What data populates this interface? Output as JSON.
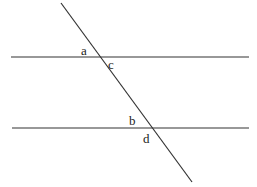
{
  "diagram": {
    "stroke_color": "#333333",
    "lines": {
      "parallel_top": {
        "x1": 11,
        "y1": 57,
        "x2": 249,
        "y2": 57
      },
      "parallel_bottom": {
        "x1": 12,
        "y1": 128,
        "x2": 249,
        "y2": 128
      },
      "transversal": {
        "x1": 61,
        "y1": 3,
        "x2": 192,
        "y2": 182
      }
    },
    "labels": {
      "a": "a",
      "b": "b",
      "c": "c",
      "d": "d"
    }
  }
}
